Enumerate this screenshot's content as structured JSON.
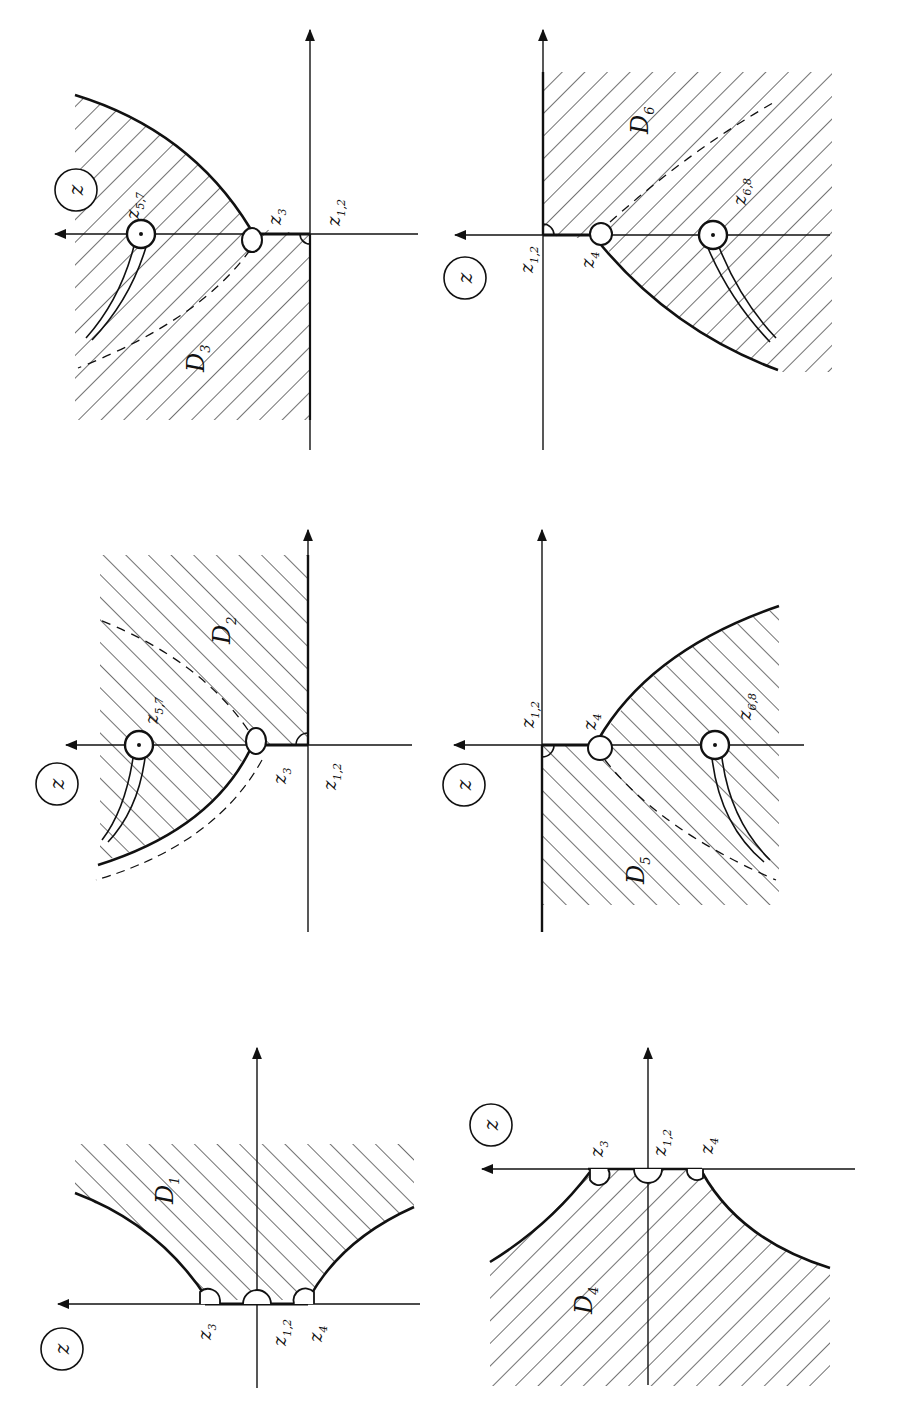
{
  "figure": {
    "plane_label": "z",
    "ink_color": "#111111",
    "background": "#ffffff"
  },
  "panels": [
    {
      "id": "D3",
      "domain_label": "D",
      "domain_sub": "3",
      "points": [
        {
          "main": "z",
          "sub": "5,7"
        },
        {
          "main": "z",
          "sub": "3"
        },
        {
          "main": "z",
          "sub": "1,2"
        }
      ]
    },
    {
      "id": "D6",
      "domain_label": "D",
      "domain_sub": "6",
      "points": [
        {
          "main": "z",
          "sub": "1,2"
        },
        {
          "main": "z",
          "sub": "4"
        },
        {
          "main": "z",
          "sub": "6,8"
        }
      ]
    },
    {
      "id": "D2",
      "domain_label": "D",
      "domain_sub": "2",
      "points": [
        {
          "main": "z",
          "sub": "5,7"
        },
        {
          "main": "z",
          "sub": "3"
        },
        {
          "main": "z",
          "sub": "1,2"
        }
      ]
    },
    {
      "id": "D5",
      "domain_label": "D",
      "domain_sub": "5",
      "points": [
        {
          "main": "z",
          "sub": "1,2"
        },
        {
          "main": "z",
          "sub": "4"
        },
        {
          "main": "z",
          "sub": "6,8"
        }
      ]
    },
    {
      "id": "D1",
      "domain_label": "D",
      "domain_sub": "1",
      "points": [
        {
          "main": "z",
          "sub": "3"
        },
        {
          "main": "z",
          "sub": "1,2"
        },
        {
          "main": "z",
          "sub": "4"
        }
      ]
    },
    {
      "id": "D4",
      "domain_label": "D",
      "domain_sub": "4",
      "points": [
        {
          "main": "z",
          "sub": "3"
        },
        {
          "main": "z",
          "sub": "1,2"
        },
        {
          "main": "z",
          "sub": "4"
        }
      ]
    }
  ]
}
